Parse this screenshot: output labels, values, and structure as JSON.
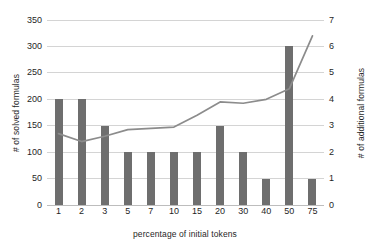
{
  "chart_data": {
    "type": "bar",
    "title": "",
    "xlabel": "percentage of initial tokens",
    "ylabel": "# of solved formulas",
    "y2label": "# of additional formulas",
    "categories": [
      "1",
      "2",
      "3",
      "5",
      "7",
      "10",
      "15",
      "20",
      "30",
      "40",
      "50",
      "75"
    ],
    "ylim": [
      0,
      350
    ],
    "yticks": [
      0,
      50,
      100,
      150,
      200,
      250,
      300,
      350
    ],
    "y2lim": [
      0,
      7
    ],
    "y2ticks": [
      0,
      1,
      2,
      3,
      4,
      5,
      6,
      7
    ],
    "grid": true,
    "legend": "none",
    "series": [
      {
        "name": "# of solved formulas",
        "type": "bar",
        "axis": "left",
        "color": "#6e6e6e",
        "values": [
          200,
          200,
          150,
          100,
          100,
          100,
          100,
          150,
          100,
          50,
          300,
          50
        ]
      },
      {
        "name": "# of additional formulas",
        "type": "line",
        "axis": "right",
        "color": "#8c8c8c",
        "values": [
          2.7,
          2.4,
          2.6,
          2.85,
          2.9,
          2.95,
          3.4,
          3.9,
          3.85,
          4.0,
          4.4,
          6.4
        ]
      }
    ]
  },
  "axes": {
    "left_title": "# of solved formulas",
    "right_title": "# of additional formulas",
    "bottom_title": "percentage of initial tokens"
  }
}
